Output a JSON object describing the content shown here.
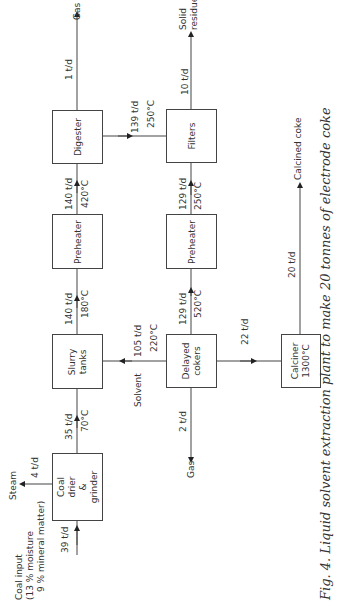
{
  "diagram": {
    "orientation": "rotated 90 degrees counter-clockwise",
    "nodes": [
      {
        "id": "coal-drier",
        "label_lines": [
          "Coal",
          "drier",
          "&",
          "grinder"
        ]
      },
      {
        "id": "slurry-tanks",
        "label_lines": [
          "Slurry",
          "tanks"
        ]
      },
      {
        "id": "preheater-1",
        "label_lines": [
          "Preheater"
        ]
      },
      {
        "id": "digester",
        "label_lines": [
          "Digester"
        ]
      },
      {
        "id": "filters",
        "label_lines": [
          "Filters"
        ]
      },
      {
        "id": "preheater-2",
        "label_lines": [
          "Preheater"
        ]
      },
      {
        "id": "delayed-cokers",
        "label_lines": [
          "Delayed",
          "cokers"
        ]
      },
      {
        "id": "calciner",
        "label_lines": [
          "Calciner",
          "1300°C"
        ]
      }
    ],
    "streams": [
      {
        "from": "Coal input",
        "to": "coal-drier",
        "flow": "39 t/d",
        "note": "(13% moisture 9% mineral matter)"
      },
      {
        "from": "coal-drier",
        "to": "Steam",
        "flow": "4 t/d"
      },
      {
        "from": "coal-drier",
        "to": "slurry-tanks",
        "flow": "35 t/d",
        "temp": "70°C"
      },
      {
        "from": "Solvent",
        "to": "slurry-tanks",
        "flow": "105 t/d",
        "temp": "220°C"
      },
      {
        "from": "slurry-tanks",
        "to": "preheater-1",
        "flow": "140 t/d",
        "temp": "180°C"
      },
      {
        "from": "preheater-1",
        "to": "digester",
        "flow": "140 t/d",
        "temp": "420°C"
      },
      {
        "from": "digester",
        "to": "Gas",
        "flow": "1 t/d"
      },
      {
        "from": "digester",
        "to": "filters",
        "flow": "139 t/d",
        "temp": "250°C"
      },
      {
        "from": "filters",
        "to": "Solid residue",
        "flow": "10 t/d"
      },
      {
        "from": "filters",
        "to": "preheater-2",
        "flow": "129 t/d",
        "temp": "250°C"
      },
      {
        "from": "preheater-2",
        "to": "delayed-cokers",
        "flow": "129 t/d",
        "temp": "520°C"
      },
      {
        "from": "delayed-cokers",
        "to": "Gas",
        "flow": "2 t/d"
      },
      {
        "from": "delayed-cokers",
        "to": "calciner",
        "flow": "22 t/d"
      },
      {
        "from": "calciner",
        "to": "Calcined coke",
        "flow": "20 t/d"
      }
    ]
  },
  "labels": {
    "coal_drier": {
      "l1": "Coal",
      "l2": "drier",
      "l3": "&",
      "l4": "grinder"
    },
    "slurry": {
      "l1": "Slurry",
      "l2": "tanks"
    },
    "preheater1": "Preheater",
    "digester": "Digester",
    "filters": "Filters",
    "preheater2": "Preheater",
    "cokers": {
      "l1": "Delayed",
      "l2": "cokers"
    },
    "calciner": {
      "l1": "Calciner",
      "l2": "1300°C"
    },
    "coal_input": {
      "l1": "Coal input",
      "l2": "(13 % moisture",
      "l3": "9 % mineral matter)"
    },
    "steam": "Steam",
    "solvent": "Solvent",
    "gas_top": "Gas",
    "gas_bottom": "Gas",
    "solid_residue": {
      "l1": "Solid",
      "l2": "residue"
    },
    "calcined_coke": "Calcined coke",
    "f_39": "39 t/d",
    "f_4": "4 t/d",
    "f_35": "35 t/d",
    "t_70": "70°C",
    "f_140a": "140 t/d",
    "t_180": "180°C",
    "f_140b": "140 t/d",
    "t_420": "420°C",
    "f_1": "1 t/d",
    "f_139": "139 t/d",
    "t_250a": "250°C",
    "f_10": "10 t/d",
    "f_129a": "129 t/d",
    "t_250b": "250°C",
    "f_129b": "129 t/d",
    "t_520": "520°C",
    "f_105": "105 t/d",
    "t_220": "220°C",
    "f_2": "2 t/d",
    "f_22": "22 t/d",
    "f_20": "20 t/d"
  },
  "caption": "Fig. 4. Liquid solvent extraction plant to make 20 tonnes of electrode coke"
}
